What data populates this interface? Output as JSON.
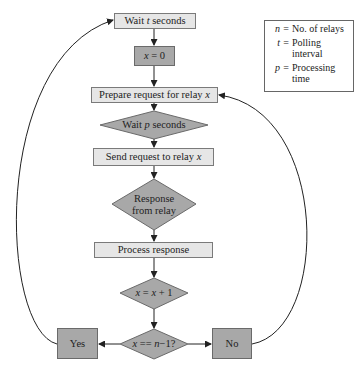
{
  "diagram": {
    "type": "flowchart",
    "nodes": {
      "wait_t": {
        "prefix": "Wait ",
        "var": "t",
        "suffix": " seconds",
        "shape": "rectangle",
        "fill": "#e6e6e6"
      },
      "x_zero": {
        "var": "x",
        "suffix": " = 0",
        "shape": "rectangle",
        "fill": "#a8a8a8"
      },
      "prepare": {
        "prefix": "Prepare request for relay ",
        "var": "x",
        "shape": "rectangle",
        "fill": "#e6e6e6"
      },
      "wait_p": {
        "prefix": "Wait ",
        "var": "p",
        "suffix": " seconds",
        "shape": "diamond",
        "fill": "#a8a8a8"
      },
      "send": {
        "prefix": "Send request to relay ",
        "var": "x",
        "shape": "rectangle",
        "fill": "#e6e6e6"
      },
      "response": {
        "line1": "Response",
        "line2": "from relay",
        "shape": "diamond",
        "fill": "#a8a8a8"
      },
      "process": {
        "label": "Process response",
        "shape": "rectangle",
        "fill": "#e6e6e6"
      },
      "increment": {
        "var": "x",
        "mid": " = ",
        "var2": "x",
        "suffix": " + 1",
        "shape": "diamond",
        "fill": "#a8a8a8"
      },
      "check": {
        "var": "x",
        "mid": " == ",
        "var2": "n",
        "suffix": "−1?",
        "shape": "diamond",
        "fill": "#a8a8a8"
      },
      "yes": {
        "label": "Yes",
        "shape": "rectangle",
        "fill": "#a8a8a8"
      },
      "no": {
        "label": "No",
        "shape": "rectangle",
        "fill": "#a8a8a8"
      }
    },
    "edges": [
      {
        "from": "wait_t",
        "to": "x_zero"
      },
      {
        "from": "x_zero",
        "to": "prepare"
      },
      {
        "from": "prepare",
        "to": "wait_p"
      },
      {
        "from": "wait_p",
        "to": "send"
      },
      {
        "from": "send",
        "to": "response"
      },
      {
        "from": "response",
        "to": "process"
      },
      {
        "from": "process",
        "to": "increment"
      },
      {
        "from": "increment",
        "to": "check"
      },
      {
        "from": "check",
        "to": "yes"
      },
      {
        "from": "check",
        "to": "no"
      },
      {
        "from": "yes",
        "to": "wait_t",
        "style": "curved"
      },
      {
        "from": "no",
        "to": "prepare",
        "style": "curved"
      }
    ],
    "legend": [
      {
        "symbol": "n",
        "eq": "=",
        "text": "No. of relays"
      },
      {
        "symbol": "t",
        "eq": "=",
        "text": "Polling interval"
      },
      {
        "symbol": "p",
        "eq": "=",
        "text": "Processing time"
      }
    ]
  }
}
